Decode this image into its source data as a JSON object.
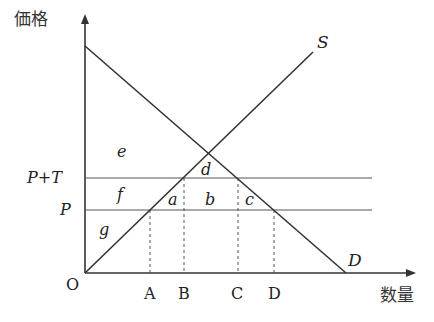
{
  "diagram": {
    "axes": {
      "y_label": "価格",
      "x_label": "数量",
      "origin_label": "O"
    },
    "curves": {
      "supply_label": "S",
      "demand_label": "D"
    },
    "price_levels": {
      "upper": "P+T",
      "lower": "P"
    },
    "quantity_ticks": [
      "A",
      "B",
      "C",
      "D"
    ],
    "regions": {
      "a": "a",
      "b": "b",
      "c": "c",
      "d": "d",
      "e": "e",
      "f": "f",
      "g": "g"
    },
    "colors": {
      "line": "#333333",
      "background": "#ffffff"
    }
  }
}
